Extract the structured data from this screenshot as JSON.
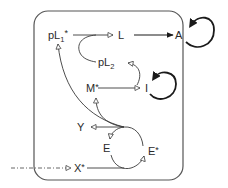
{
  "diagram": {
    "type": "signaling-network",
    "nodes": {
      "pL1": {
        "base": "pL",
        "sub": "1",
        "sup": "*"
      },
      "pL2": {
        "base": "pL",
        "sub": "2"
      },
      "L": {
        "label": "L"
      },
      "A": {
        "label": "A"
      },
      "M": {
        "label": "M*"
      },
      "I": {
        "label": "I"
      },
      "Y": {
        "label": "Y"
      },
      "E": {
        "label": "E"
      },
      "Estar": {
        "label": "E*"
      },
      "Xstar": {
        "label": "X*"
      }
    },
    "edges": [
      {
        "from": "pL1*",
        "to": "L",
        "style": "open-arrow"
      },
      {
        "from": "L",
        "to": "A",
        "style": "filled-arrow"
      },
      {
        "from": "A",
        "to": "A",
        "style": "thick-self-loop"
      },
      {
        "from": "pL1*-line",
        "to": "pL2",
        "style": "curve"
      },
      {
        "from": "I",
        "to": "pL2",
        "style": "open-arrow-curve"
      },
      {
        "from": "M*",
        "to": "I",
        "style": "open-arrow"
      },
      {
        "from": "I",
        "to": "I",
        "style": "thick-self-loop"
      },
      {
        "from": "E-cycle",
        "to": "Y",
        "style": "open-arrow"
      },
      {
        "from": "E-cycle",
        "to": "M*",
        "style": "open-arrow-curve"
      },
      {
        "from": "E-cycle",
        "to": "pL1*",
        "style": "open-arrow-curve"
      },
      {
        "from": "E*",
        "to": "E",
        "style": "open-arrow-arc"
      },
      {
        "from": "E",
        "to": "E*",
        "style": "open-arrow-arc"
      },
      {
        "from": "outside",
        "to": "X*",
        "style": "dash-dot-open-arrow"
      },
      {
        "from": "X*",
        "to": "E-cycle",
        "style": "line"
      }
    ]
  }
}
